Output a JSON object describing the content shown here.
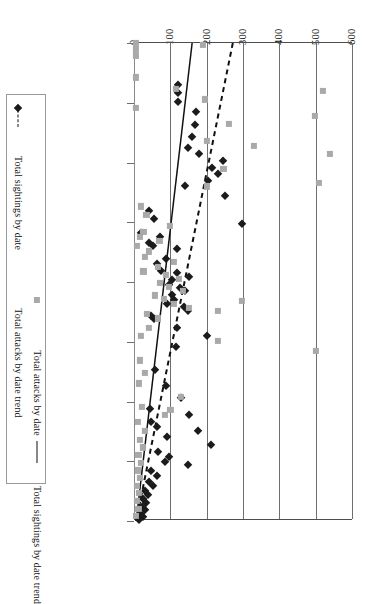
{
  "chart_data": {
    "type": "scatter",
    "title": "",
    "subtitle": "",
    "xlabel": "",
    "ylabel": "",
    "orientation": "horizontal-value-vertical-date",
    "grid": true,
    "legend_position": "left",
    "xlim": [
      0,
      600
    ],
    "xticks": [
      0,
      100,
      200,
      300,
      400,
      500,
      600
    ],
    "xtick_labels": [
      "0",
      "100",
      "200",
      "300",
      "400",
      "500",
      "600"
    ],
    "ytick_labels": [
      "11/24/1944",
      "12/24/1944",
      "1/23/1945",
      "2/22/1945",
      "3/24/1945",
      "4/23/1945",
      "5/23/1945",
      "6/22/1945",
      "7/22/1945"
    ],
    "ytick_positions_frac": [
      0.0,
      0.125,
      0.25,
      0.375,
      0.5,
      0.625,
      0.75,
      0.875,
      1.0
    ],
    "legend": [
      {
        "id": "sightings",
        "label": "Total sightings by date",
        "marker": "diamond",
        "color": "#1b1b1b"
      },
      {
        "id": "attacks-trend",
        "label": "Total attacks by date trend",
        "marker": "dashed-line",
        "color": "#111111"
      },
      {
        "id": "attacks",
        "label": "Total attacks by date",
        "marker": "square",
        "color": "#a9a9a9"
      },
      {
        "id": "sightings-trend",
        "label": "Total sightings by date trend",
        "marker": "solid-line",
        "color": "#111111"
      }
    ],
    "series": [
      {
        "name": "Total sightings by date",
        "marker": "diamond",
        "color": "#1b1b1b",
        "points": [
          {
            "x": 122,
            "t": 0.088
          },
          {
            "x": 122,
            "t": 0.104
          },
          {
            "x": 122,
            "t": 0.124
          },
          {
            "x": 170,
            "t": 0.145
          },
          {
            "x": 168,
            "t": 0.172
          },
          {
            "x": 160,
            "t": 0.197
          },
          {
            "x": 148,
            "t": 0.219
          },
          {
            "x": 180,
            "t": 0.232
          },
          {
            "x": 246,
            "t": 0.246
          },
          {
            "x": 214,
            "t": 0.262
          },
          {
            "x": 230,
            "t": 0.274
          },
          {
            "x": 205,
            "t": 0.289
          },
          {
            "x": 140,
            "t": 0.3
          },
          {
            "x": 250,
            "t": 0.321
          },
          {
            "x": 40,
            "t": 0.352
          },
          {
            "x": 55,
            "t": 0.368
          },
          {
            "x": 298,
            "t": 0.378
          },
          {
            "x": 20,
            "t": 0.398
          },
          {
            "x": 72,
            "t": 0.406
          },
          {
            "x": 40,
            "t": 0.418
          },
          {
            "x": 52,
            "t": 0.424
          },
          {
            "x": 118,
            "t": 0.432
          },
          {
            "x": 88,
            "t": 0.452
          },
          {
            "x": 62,
            "t": 0.462
          },
          {
            "x": 74,
            "t": 0.476
          },
          {
            "x": 118,
            "t": 0.482
          },
          {
            "x": 150,
            "t": 0.489
          },
          {
            "x": 104,
            "t": 0.496
          },
          {
            "x": 96,
            "t": 0.506
          },
          {
            "x": 126,
            "t": 0.512
          },
          {
            "x": 140,
            "t": 0.518
          },
          {
            "x": 104,
            "t": 0.528
          },
          {
            "x": 110,
            "t": 0.538
          },
          {
            "x": 92,
            "t": 0.546
          },
          {
            "x": 138,
            "t": 0.552
          },
          {
            "x": 148,
            "t": 0.56
          },
          {
            "x": 46,
            "t": 0.572
          },
          {
            "x": 56,
            "t": 0.578
          },
          {
            "x": 118,
            "t": 0.596
          },
          {
            "x": 200,
            "t": 0.612
          },
          {
            "x": 116,
            "t": 0.636
          },
          {
            "x": 58,
            "t": 0.684
          },
          {
            "x": 88,
            "t": 0.718
          },
          {
            "x": 128,
            "t": 0.742
          },
          {
            "x": 44,
            "t": 0.766
          },
          {
            "x": 150,
            "t": 0.778
          },
          {
            "x": 48,
            "t": 0.792
          },
          {
            "x": 62,
            "t": 0.804
          },
          {
            "x": 176,
            "t": 0.812
          },
          {
            "x": 92,
            "t": 0.824
          },
          {
            "x": 212,
            "t": 0.84
          },
          {
            "x": 66,
            "t": 0.856
          },
          {
            "x": 96,
            "t": 0.866
          },
          {
            "x": 84,
            "t": 0.876
          },
          {
            "x": 148,
            "t": 0.882
          },
          {
            "x": 46,
            "t": 0.896
          },
          {
            "x": 64,
            "t": 0.906
          },
          {
            "x": 40,
            "t": 0.918
          },
          {
            "x": 52,
            "t": 0.926
          },
          {
            "x": 30,
            "t": 0.938
          },
          {
            "x": 38,
            "t": 0.946
          },
          {
            "x": 26,
            "t": 0.954
          },
          {
            "x": 34,
            "t": 0.962
          },
          {
            "x": 22,
            "t": 0.97
          },
          {
            "x": 30,
            "t": 0.978
          },
          {
            "x": 18,
            "t": 0.986
          },
          {
            "x": 24,
            "t": 0.992
          },
          {
            "x": 14,
            "t": 0.998
          }
        ]
      },
      {
        "name": "Total attacks by date",
        "marker": "square",
        "color": "#a9a9a9",
        "points": [
          {
            "x": 6,
            "t": 0.0
          },
          {
            "x": 6,
            "t": 0.012
          },
          {
            "x": 6,
            "t": 0.026
          },
          {
            "x": 190,
            "t": 0.004
          },
          {
            "x": 6,
            "t": 0.072
          },
          {
            "x": 116,
            "t": 0.096
          },
          {
            "x": 520,
            "t": 0.1
          },
          {
            "x": 196,
            "t": 0.118
          },
          {
            "x": 6,
            "t": 0.136
          },
          {
            "x": 498,
            "t": 0.152
          },
          {
            "x": 262,
            "t": 0.17
          },
          {
            "x": 200,
            "t": 0.205
          },
          {
            "x": 540,
            "t": 0.232
          },
          {
            "x": 330,
            "t": 0.216
          },
          {
            "x": 246,
            "t": 0.264
          },
          {
            "x": 510,
            "t": 0.292
          },
          {
            "x": 200,
            "t": 0.3
          },
          {
            "x": 20,
            "t": 0.342
          },
          {
            "x": 34,
            "t": 0.36
          },
          {
            "x": 98,
            "t": 0.382
          },
          {
            "x": 26,
            "t": 0.396
          },
          {
            "x": 16,
            "t": 0.406
          },
          {
            "x": 70,
            "t": 0.414
          },
          {
            "x": 8,
            "t": 0.424
          },
          {
            "x": 42,
            "t": 0.436
          },
          {
            "x": 30,
            "t": 0.448
          },
          {
            "x": 110,
            "t": 0.458
          },
          {
            "x": 66,
            "t": 0.468
          },
          {
            "x": 26,
            "t": 0.478
          },
          {
            "x": 88,
            "t": 0.486
          },
          {
            "x": 124,
            "t": 0.494
          },
          {
            "x": 72,
            "t": 0.502
          },
          {
            "x": 96,
            "t": 0.51
          },
          {
            "x": 134,
            "t": 0.518
          },
          {
            "x": 58,
            "t": 0.528
          },
          {
            "x": 82,
            "t": 0.536
          },
          {
            "x": 110,
            "t": 0.546
          },
          {
            "x": 150,
            "t": 0.554
          },
          {
            "x": 36,
            "t": 0.566
          },
          {
            "x": 66,
            "t": 0.576
          },
          {
            "x": 230,
            "t": 0.56
          },
          {
            "x": 296,
            "t": 0.54
          },
          {
            "x": 40,
            "t": 0.596
          },
          {
            "x": 18,
            "t": 0.612
          },
          {
            "x": 230,
            "t": 0.624
          },
          {
            "x": 500,
            "t": 0.644
          },
          {
            "x": 16,
            "t": 0.664
          },
          {
            "x": 30,
            "t": 0.69
          },
          {
            "x": 14,
            "t": 0.712
          },
          {
            "x": 128,
            "t": 0.74
          },
          {
            "x": 22,
            "t": 0.762
          },
          {
            "x": 86,
            "t": 0.778
          },
          {
            "x": 10,
            "t": 0.792
          },
          {
            "x": 30,
            "t": 0.812
          },
          {
            "x": 16,
            "t": 0.83
          },
          {
            "x": 24,
            "t": 0.846
          },
          {
            "x": 12,
            "t": 0.862
          },
          {
            "x": 20,
            "t": 0.878
          },
          {
            "x": 10,
            "t": 0.894
          },
          {
            "x": 16,
            "t": 0.91
          },
          {
            "x": 8,
            "t": 0.926
          },
          {
            "x": 14,
            "t": 0.942
          },
          {
            "x": 8,
            "t": 0.958
          },
          {
            "x": 12,
            "t": 0.974
          },
          {
            "x": 6,
            "t": 0.99
          },
          {
            "x": 100,
            "t": 0.768
          }
        ]
      }
    ],
    "trends": [
      {
        "name": "Total sightings by date trend",
        "style": "solid",
        "color": "#111111",
        "x_start": 160,
        "x_end": 6,
        "t_start": 0.0,
        "t_end": 1.0
      },
      {
        "name": "Total attacks by date trend",
        "style": "dashed",
        "color": "#111111",
        "x_start": 272,
        "x_end": 6,
        "t_start": 0.0,
        "t_end": 1.0
      }
    ]
  }
}
